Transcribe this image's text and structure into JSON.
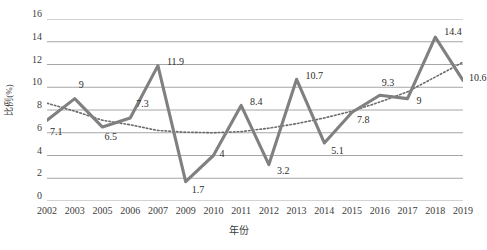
{
  "chart_data": {
    "type": "line",
    "title": "",
    "xlabel": "年份",
    "ylabel": "比例(%)",
    "categories": [
      "2002",
      "2003",
      "2005",
      "2006",
      "2007",
      "2009",
      "2010",
      "2011",
      "2012",
      "2013",
      "2014",
      "2015",
      "2016",
      "2017",
      "2018",
      "2019"
    ],
    "values": [
      7.1,
      9,
      6.5,
      7.3,
      11.9,
      1.7,
      4,
      8.4,
      3.2,
      10.7,
      5.1,
      7.8,
      9.3,
      9,
      14.4,
      10.6
    ],
    "point_labels": [
      "7.1",
      "9",
      "6.5",
      "7.3",
      "11.9",
      "1.7",
      "4",
      "8.4",
      "3.2",
      "10.7",
      "5.1",
      "7.8",
      "9.3",
      "9",
      "14.4",
      "10.6"
    ],
    "series": [
      {
        "name": "比例(%)",
        "style": "solid",
        "color": "#808080",
        "values": [
          7.1,
          9,
          6.5,
          7.3,
          11.9,
          1.7,
          4,
          8.4,
          3.2,
          10.7,
          5.1,
          7.8,
          9.3,
          9,
          14.4,
          10.6
        ]
      },
      {
        "name": "趋势线",
        "style": "dotted",
        "color": "#6b6b6b",
        "values": [
          8.6,
          7.9,
          7.1,
          6.7,
          6.2,
          6.05,
          6.0,
          6.1,
          6.4,
          6.8,
          7.3,
          7.9,
          8.7,
          9.6,
          10.9,
          12.2
        ]
      }
    ],
    "ylim": [
      0,
      16
    ],
    "yticks": [
      0,
      2,
      4,
      6,
      8,
      10,
      12,
      14,
      16
    ],
    "ytick_labels": [
      "0",
      "2",
      "4",
      "6",
      "8",
      "10",
      "12",
      "14",
      "16"
    ],
    "grid": "horizontal",
    "legend": "none",
    "gridline_color": "#a6a6a6"
  },
  "axes": {
    "y_title": "比例(%)",
    "x_title": "年份"
  }
}
